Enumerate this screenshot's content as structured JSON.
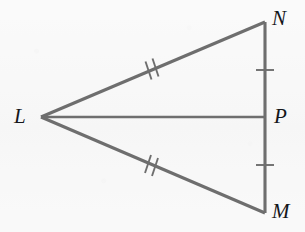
{
  "figure": {
    "type": "geometry-diagram",
    "background_color": "#f8f8f8",
    "stroke_color": "#6e6e6e",
    "label_color": "#15161a",
    "points": [
      {
        "name": "L",
        "label": "L",
        "x": 41,
        "y": 117,
        "label_x": 14,
        "label_y": 106
      },
      {
        "name": "N",
        "label": "N",
        "x": 265,
        "y": 22,
        "label_x": 272,
        "label_y": 8
      },
      {
        "name": "P",
        "label": "P",
        "x": 265,
        "y": 117,
        "label_x": 274,
        "label_y": 106
      },
      {
        "name": "M",
        "label": "M",
        "x": 265,
        "y": 213,
        "label_x": 272,
        "label_y": 201
      }
    ],
    "segments": [
      {
        "name": "segment-LN",
        "from": "L",
        "to": "N",
        "ticks": 2
      },
      {
        "name": "segment-LM",
        "from": "L",
        "to": "M",
        "ticks": 2
      },
      {
        "name": "segment-LP",
        "from": "L",
        "to": "P",
        "ticks": 0
      },
      {
        "name": "segment-NP",
        "from": "N",
        "to": "P",
        "ticks": 1
      },
      {
        "name": "segment-PM",
        "from": "P",
        "to": "M",
        "ticks": 1
      }
    ],
    "tick_marks": [
      {
        "name": "tick-LN-double",
        "on": "segment-LN",
        "count": 2,
        "x": 150,
        "y": 70
      },
      {
        "name": "tick-LM-double",
        "on": "segment-LM",
        "count": 2,
        "x": 150,
        "y": 165
      },
      {
        "name": "tick-NP-single",
        "on": "segment-NP",
        "count": 1,
        "x": 265,
        "y": 70
      },
      {
        "name": "tick-PM-single",
        "on": "segment-PM",
        "count": 1,
        "x": 265,
        "y": 165
      }
    ]
  }
}
